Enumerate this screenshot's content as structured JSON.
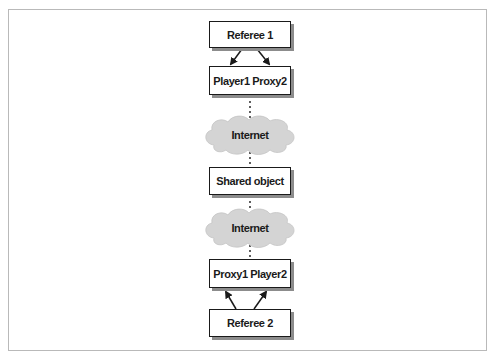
{
  "diagram": {
    "nodes": {
      "referee1": {
        "label": "Referee 1",
        "shape": "box"
      },
      "player1_proxy2": {
        "label": "Player1 Proxy2",
        "shape": "box"
      },
      "internet_top": {
        "label": "Internet",
        "shape": "cloud"
      },
      "shared_object": {
        "label": "Shared object",
        "shape": "box"
      },
      "internet_bottom": {
        "label": "Internet",
        "shape": "cloud"
      },
      "proxy1_player2": {
        "label": "Proxy1 Player2",
        "shape": "box"
      },
      "referee2": {
        "label": "Referee 2",
        "shape": "box"
      }
    },
    "edges": [
      {
        "from": "referee1",
        "to": "player1_proxy2",
        "style": "arrow",
        "count": 2
      },
      {
        "from": "player1_proxy2",
        "to": "internet_top",
        "style": "dotted"
      },
      {
        "from": "internet_top",
        "to": "shared_object",
        "style": "dotted"
      },
      {
        "from": "shared_object",
        "to": "internet_bottom",
        "style": "dotted"
      },
      {
        "from": "internet_bottom",
        "to": "proxy1_player2",
        "style": "dotted"
      },
      {
        "from": "referee2",
        "to": "proxy1_player2",
        "style": "arrow",
        "count": 2
      }
    ],
    "colors": {
      "stroke": "#1a1a1a",
      "shadow": "#8c8c8c",
      "cloud_fill": "#d4d4d4",
      "frame": "#b9b9b9"
    }
  }
}
